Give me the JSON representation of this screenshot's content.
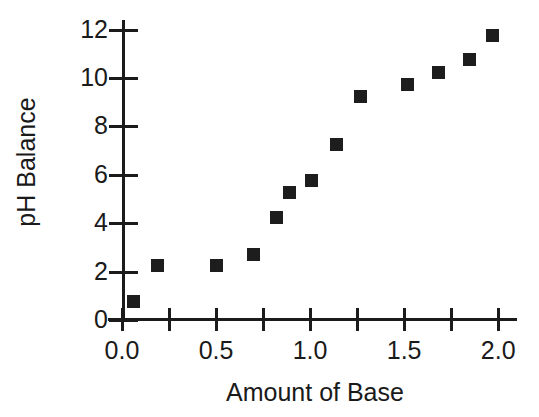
{
  "chart": {
    "type": "scatter",
    "title": "",
    "xlabel": "Amount of Base",
    "ylabel": "pH Balance",
    "marker_color": "#1d1d1d",
    "axis_color": "#1b1b1b",
    "background": "#ffffff"
  },
  "axes": {
    "x": {
      "label": "Amount of Base",
      "min": 0.0,
      "max": 2.1,
      "major_tick_labels": [
        "0.0",
        "0.5",
        "1.0",
        "1.5",
        "2.0"
      ],
      "major_tick_values": [
        0.0,
        0.5,
        1.0,
        1.5,
        2.0
      ],
      "minor_tick_values": [
        0.25,
        0.75,
        1.25,
        1.75
      ],
      "grid": false
    },
    "y": {
      "label": "pH Balance",
      "min": 0,
      "max": 12.4,
      "major_tick_labels": [
        "0",
        "2",
        "4",
        "6",
        "8",
        "10",
        "12"
      ],
      "major_tick_values": [
        0,
        2,
        4,
        6,
        8,
        10,
        12
      ],
      "grid": false
    }
  },
  "chart_data": {
    "type": "scatter",
    "title": "",
    "xlabel": "Amount of Base",
    "ylabel": "pH Balance",
    "xlim": [
      0.0,
      2.1
    ],
    "ylim": [
      0,
      12.4
    ],
    "xticks": [
      0.0,
      0.5,
      1.0,
      1.5,
      2.0
    ],
    "xtick_labels": [
      "0.0",
      "0.5",
      "1.0",
      "1.5",
      "2.0"
    ],
    "yticks": [
      0,
      2,
      4,
      6,
      8,
      10,
      12
    ],
    "ytick_labels": [
      "0",
      "2",
      "4",
      "6",
      "8",
      "10",
      "12"
    ],
    "grid": false,
    "legend": null,
    "series": [
      {
        "name": "pH Balance",
        "marker": "square",
        "color": "#1d1d1d",
        "points": [
          {
            "x": 0.06,
            "y": 0.75
          },
          {
            "x": 0.19,
            "y": 2.25
          },
          {
            "x": 0.5,
            "y": 2.25
          },
          {
            "x": 0.7,
            "y": 2.7
          },
          {
            "x": 0.82,
            "y": 4.25
          },
          {
            "x": 0.89,
            "y": 5.25
          },
          {
            "x": 1.01,
            "y": 5.75
          },
          {
            "x": 1.14,
            "y": 7.25
          },
          {
            "x": 1.27,
            "y": 9.25
          },
          {
            "x": 1.52,
            "y": 9.75
          },
          {
            "x": 1.68,
            "y": 10.25
          },
          {
            "x": 1.85,
            "y": 10.75
          },
          {
            "x": 1.97,
            "y": 11.75
          }
        ]
      }
    ]
  }
}
